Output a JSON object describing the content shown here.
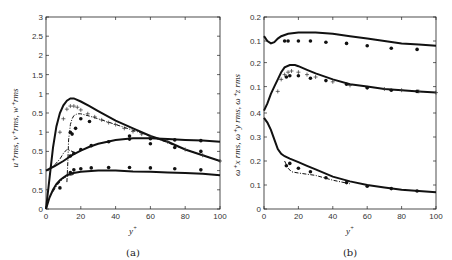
{
  "chart_data": [
    {
      "type": "line",
      "panel_label": "(a)",
      "xlabel": "y+",
      "ylabel": "u+rms, v+rms, w+rms",
      "xlim": [
        0,
        100
      ],
      "x_ticks": [
        "0",
        "20",
        "40",
        "60",
        "80",
        "100"
      ],
      "y_tick_labels_stacked": [
        "0",
        "0.5",
        "1",
        "0.5",
        "1",
        "0.5",
        "1",
        "1.5",
        "2",
        "2.5",
        "3"
      ],
      "stacked_offsets": {
        "u_rms": 0,
        "v_rms": 1.0,
        "w_rms": 2.0
      },
      "note": "Three stacked sub-panels sharing one axis; top = u_rms, middle = w_rms, bottom = v_rms (offsets applied to raw axis).",
      "series": [
        {
          "name": "top curve solid",
          "style": "solid",
          "offset": 2.0,
          "x": [
            0,
            2,
            4,
            6,
            8,
            10,
            12,
            14,
            16,
            20,
            25,
            30,
            40,
            50,
            60,
            70,
            80,
            90,
            100
          ],
          "y": [
            -2.0,
            -1.2,
            -0.4,
            0.15,
            0.5,
            0.7,
            0.82,
            0.88,
            0.88,
            0.8,
            0.68,
            0.55,
            0.3,
            0.1,
            -0.1,
            -0.25,
            -0.45,
            -0.6,
            -0.75
          ]
        },
        {
          "name": "top curve dash-dot",
          "style": "dashdot",
          "offset": 2.0,
          "x": [
            12,
            12.5,
            13,
            14,
            15,
            16,
            18,
            20,
            25,
            30,
            40,
            50,
            60,
            80,
            100
          ],
          "y": [
            -1.3,
            -0.8,
            -0.2,
            0.2,
            0.35,
            0.43,
            0.48,
            0.48,
            0.42,
            0.35,
            0.2,
            0.05,
            -0.1,
            -0.45,
            -0.75
          ]
        },
        {
          "name": "top curve plus markers",
          "style": "plus",
          "offset": 2.0,
          "x": [
            8,
            10,
            12,
            14,
            16,
            18,
            20,
            24,
            28,
            32,
            36,
            40,
            45,
            50,
            55,
            60,
            70,
            80,
            90,
            100
          ],
          "y": [
            0.0,
            0.35,
            0.6,
            0.68,
            0.68,
            0.65,
            0.58,
            0.48,
            0.4,
            0.32,
            0.25,
            0.2,
            0.1,
            0.02,
            -0.05,
            -0.12,
            -0.25,
            -0.45,
            -0.6,
            -0.75
          ]
        },
        {
          "name": "top curve dot markers",
          "style": "dot",
          "offset": 2.0,
          "x": [
            14,
            15,
            17,
            20,
            25,
            48,
            60,
            74,
            89
          ],
          "y": [
            0.0,
            -0.05,
            0.1,
            0.35,
            0.28,
            -0.1,
            -0.3,
            -0.4,
            -0.5
          ]
        },
        {
          "name": "middle curve solid",
          "style": "solid",
          "offset": 1.0,
          "x": [
            0,
            5,
            10,
            15,
            20,
            25,
            30,
            40,
            50,
            60,
            70,
            80,
            90,
            100
          ],
          "y": [
            0.0,
            0.12,
            0.25,
            0.4,
            0.52,
            0.62,
            0.7,
            0.8,
            0.84,
            0.84,
            0.82,
            0.8,
            0.78,
            0.75
          ]
        },
        {
          "name": "middle curve dash-dot",
          "style": "dashdot",
          "offset": 1.0,
          "x": [
            5,
            8,
            10,
            12,
            14,
            16
          ],
          "y": [
            0.15,
            0.3,
            0.45,
            0.55,
            0.52,
            0.48
          ]
        },
        {
          "name": "middle curve dot markers",
          "style": "dot",
          "offset": 1.0,
          "x": [
            14,
            16,
            20,
            26,
            36,
            48,
            60,
            74,
            89
          ],
          "y": [
            0.38,
            0.45,
            0.55,
            0.65,
            0.75,
            0.82,
            0.83,
            0.8,
            0.78
          ]
        },
        {
          "name": "bottom curve solid",
          "style": "solid",
          "offset": 0.0,
          "x": [
            0,
            2,
            4,
            6,
            8,
            10,
            12,
            15,
            20,
            30,
            40,
            50,
            60,
            70,
            80,
            90,
            100
          ],
          "y": [
            0.0,
            0.3,
            0.5,
            0.65,
            0.75,
            0.82,
            0.88,
            0.93,
            0.97,
            1.0,
            1.0,
            0.98,
            0.97,
            0.95,
            0.94,
            0.92,
            0.88
          ]
        },
        {
          "name": "bottom curve dash-dot",
          "style": "dashdot",
          "offset": 0.0,
          "x": [
            4,
            6,
            8,
            10,
            12,
            14,
            16
          ],
          "y": [
            0.45,
            0.6,
            0.7,
            0.8,
            0.85,
            0.88,
            0.9
          ]
        },
        {
          "name": "bottom curve dot markers",
          "style": "dot",
          "offset": 0.0,
          "x": [
            8,
            14,
            16,
            20,
            26,
            36,
            48,
            60,
            74,
            89
          ],
          "y": [
            0.55,
            0.95,
            1.02,
            1.05,
            1.07,
            1.08,
            1.08,
            1.07,
            1.05,
            1.02
          ]
        }
      ]
    },
    {
      "type": "line",
      "panel_label": "(b)",
      "xlabel": "y+",
      "ylabel": "ω+x rms, ω+y rms, ω+z rms",
      "xlim": [
        0,
        100
      ],
      "x_ticks": [
        "0",
        "20",
        "40",
        "60",
        "80",
        "100"
      ],
      "y_tick_labels_stacked": [
        "0",
        "0.1",
        "0.2",
        "0.3",
        "0.4",
        "0.1",
        "0.2",
        "0.1",
        "0.2"
      ],
      "stacked_offsets": {
        "omega_x": 0,
        "omega_y": 0.41,
        "omega_z": 0.6
      },
      "series": [
        {
          "name": "top curve solid",
          "style": "solid",
          "offset": 0.6,
          "x": [
            0,
            2,
            4,
            6,
            8,
            10,
            14,
            20,
            30,
            40,
            50,
            60,
            70,
            80,
            90,
            100
          ],
          "y": [
            0.12,
            0.1,
            0.09,
            0.095,
            0.11,
            0.12,
            0.13,
            0.135,
            0.135,
            0.13,
            0.12,
            0.11,
            0.1,
            0.09,
            0.085,
            0.08
          ]
        },
        {
          "name": "top curve dot markers",
          "style": "dot",
          "offset": 0.6,
          "x": [
            12,
            14,
            20,
            27,
            36,
            48,
            60,
            74,
            89
          ],
          "y": [
            0.1,
            0.1,
            0.1,
            0.1,
            0.095,
            0.09,
            0.08,
            0.07,
            0.065
          ]
        },
        {
          "name": "middle curve solid",
          "style": "solid",
          "offset": 0.41,
          "x": [
            0,
            2,
            4,
            6,
            8,
            10,
            12,
            15,
            18,
            20,
            25,
            30,
            40,
            50,
            60,
            70,
            80,
            90,
            100
          ],
          "y": [
            0.0,
            0.03,
            0.07,
            0.1,
            0.13,
            0.16,
            0.18,
            0.19,
            0.19,
            0.185,
            0.17,
            0.155,
            0.13,
            0.11,
            0.1,
            0.09,
            0.085,
            0.08,
            0.075
          ]
        },
        {
          "name": "middle curve plus markers",
          "style": "plus",
          "offset": 0.41,
          "x": [
            8,
            10,
            12,
            14,
            16,
            20,
            25,
            30,
            40,
            50,
            60,
            70,
            80,
            90,
            100
          ],
          "y": [
            0.08,
            0.13,
            0.15,
            0.16,
            0.165,
            0.16,
            0.15,
            0.14,
            0.12,
            0.105,
            0.095,
            0.09,
            0.085,
            0.08,
            0.075
          ]
        },
        {
          "name": "middle curve dot markers",
          "style": "dot",
          "offset": 0.41,
          "x": [
            13,
            15,
            20,
            27,
            36,
            48,
            60,
            74,
            89
          ],
          "y": [
            0.14,
            0.145,
            0.145,
            0.135,
            0.125,
            0.11,
            0.095,
            0.085,
            0.08
          ]
        },
        {
          "name": "bottom curve solid",
          "style": "solid",
          "offset": 0.0,
          "x": [
            0,
            2,
            4,
            6,
            8,
            10,
            12,
            15,
            20,
            25,
            30,
            40,
            50,
            60,
            70,
            80,
            90,
            100
          ],
          "y": [
            0.38,
            0.36,
            0.33,
            0.29,
            0.25,
            0.23,
            0.22,
            0.21,
            0.195,
            0.18,
            0.165,
            0.135,
            0.115,
            0.1,
            0.09,
            0.08,
            0.075,
            0.07
          ]
        },
        {
          "name": "bottom curve dash-dot",
          "style": "dashdot",
          "offset": 0.0,
          "x": [
            12,
            14,
            16,
            20,
            25,
            30,
            40,
            50
          ],
          "y": [
            0.2,
            0.17,
            0.155,
            0.15,
            0.145,
            0.14,
            0.12,
            0.105
          ]
        },
        {
          "name": "bottom curve dot markers",
          "style": "dot",
          "offset": 0.0,
          "x": [
            13,
            15,
            20,
            27,
            36,
            48,
            60,
            74,
            89
          ],
          "y": [
            0.18,
            0.19,
            0.17,
            0.155,
            0.13,
            0.11,
            0.095,
            0.085,
            0.075
          ]
        }
      ]
    }
  ],
  "captions": {
    "a": "(a)",
    "b": "(b)"
  },
  "labels": {
    "a_xlabel": "y",
    "a_xlabel_sup": "+",
    "a_ylabel": "u⁺rms, v⁺rms, w⁺rms",
    "b_xlabel": "y",
    "b_xlabel_sup": "+",
    "b_ylabel": "ω⁺x rms, ω⁺y rms, ω⁺z rms"
  }
}
